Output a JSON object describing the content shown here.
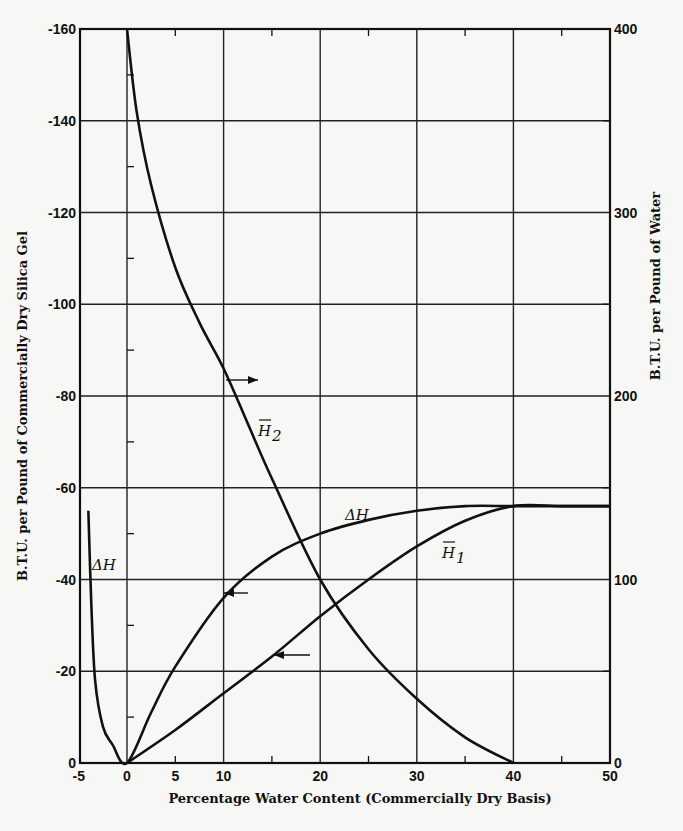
{
  "chart_data": {
    "type": "line",
    "title": "",
    "xlabel": "Percentage Water Content (Commercially Dry Basis)",
    "ylabel": "B.T.U. per Pound of Commercially Dry Silica Gel",
    "ylabel_right": "B.T.U. per Pound of Water",
    "xlim": [
      -5,
      50
    ],
    "ylim": [
      0,
      -160
    ],
    "ylim_right": [
      0,
      400
    ],
    "grid": true,
    "x_ticks": [
      "-5",
      "0",
      "5",
      "10",
      "20",
      "30",
      "40",
      "50"
    ],
    "y_ticks": [
      "0",
      "-20",
      "-40",
      "-60",
      "-80",
      "-100",
      "-120",
      "-140",
      "-160"
    ],
    "y_ticks_right": [
      "0",
      "100",
      "200",
      "300",
      "400"
    ],
    "series": [
      {
        "name": "ΔH",
        "axis": "left",
        "x": [
          -4.0,
          -3.7,
          -3.3,
          -2.5,
          -1.5,
          0,
          2.5,
          5,
          10,
          15,
          20,
          25,
          30,
          35,
          40,
          45,
          50
        ],
        "y": [
          -55,
          -35,
          -18,
          -8,
          -4,
          0,
          -11,
          -21,
          -36,
          -45,
          -50,
          -53,
          -55,
          -56,
          -56,
          -56,
          -56
        ]
      },
      {
        "name": "H̄1",
        "axis": "right",
        "x": [
          0,
          5,
          10,
          15,
          20,
          25,
          30,
          35,
          40,
          45,
          50
        ],
        "y": [
          0,
          18,
          38,
          58,
          80,
          100,
          118,
          132,
          140,
          140,
          140
        ]
      },
      {
        "name": "H̄2",
        "axis": "right",
        "x": [
          0,
          1,
          2.5,
          5,
          7.5,
          10,
          12.5,
          15,
          20,
          25,
          30,
          35,
          40
        ],
        "y": [
          400,
          355,
          315,
          270,
          240,
          215,
          185,
          155,
          100,
          62,
          35,
          14,
          0
        ]
      }
    ],
    "annotations": [
      {
        "text": "ΔH",
        "x": -3,
        "y": -43,
        "axis": "left"
      },
      {
        "text": "ΔH",
        "x": 19,
        "y": -51,
        "axis": "left"
      },
      {
        "text": "H̄1",
        "x": 30,
        "y": 112,
        "axis": "right"
      },
      {
        "text": "H̄2",
        "x": 12,
        "y": 180,
        "axis": "right"
      },
      {
        "text": "→ (read right axis)",
        "x": 11,
        "y": -84,
        "axis": "left"
      },
      {
        "text": "← (read left axis)",
        "x": 10,
        "y": -38,
        "axis": "left"
      },
      {
        "text": "← (read left axis)",
        "x": 15,
        "y": -24,
        "axis": "left"
      }
    ]
  },
  "labels": {
    "xlabel": "Percentage Water Content (Commercially Dry Basis)",
    "ylabel": "B.T.U. per Pound of Commercially Dry Silica Gel",
    "ylabel_right": "B.T.U. per Pound of Water",
    "dh_left": "ΔH",
    "dh_mid": "ΔH",
    "h1": "H",
    "h1_sub": "1",
    "h2": "H",
    "h2_sub": "2"
  }
}
